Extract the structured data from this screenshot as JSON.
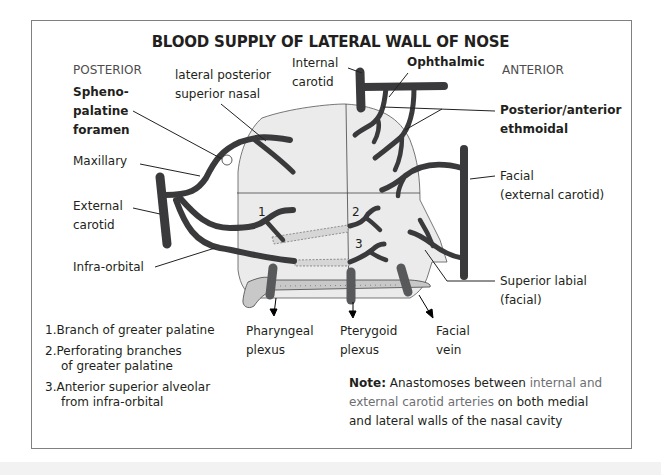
{
  "title": "BLOOD SUPPLY OF LATERAL WALL OF NOSE",
  "orientation": {
    "posterior": "POSTERIOR",
    "anterior": "ANTERIOR"
  },
  "labels": {
    "sphenopalatine_foramen": [
      "Spheno-",
      "palatine",
      "foramen"
    ],
    "lateral_posterior_superior_nasal": [
      "lateral posterior",
      "superior nasal"
    ],
    "internal_carotid": [
      "Internal",
      "carotid"
    ],
    "ophthalmic": "Ophthalmic",
    "posterior_anterior_ethmoidal": [
      "Posterior/anterior",
      "ethmoidal"
    ],
    "maxillary": "Maxillary",
    "external_carotid": [
      "External",
      "carotid"
    ],
    "facial_external_carotid": [
      "Facial",
      "(external carotid)"
    ],
    "infra_orbital": "Infra-orbital",
    "superior_labial": [
      "Superior labial",
      "(facial)"
    ],
    "pharyngeal_plexus": [
      "Pharyngeal",
      "plexus"
    ],
    "pterygoid_plexus": [
      "Pterygoid",
      "plexus"
    ],
    "facial_vein": [
      "Facial",
      "vein"
    ]
  },
  "region_numbers": [
    "1",
    "2",
    "3"
  ],
  "legend": [
    {
      "num": "1.",
      "lines": [
        "Branch of greater palatine"
      ]
    },
    {
      "num": "2.",
      "lines": [
        "Perforating  branches",
        "of greater palatine"
      ]
    },
    {
      "num": "3.",
      "lines": [
        "Anterior superior alveolar",
        "from  infra-orbital"
      ]
    }
  ],
  "note": {
    "prefix": "Note:",
    "text_a": " Anastomoses between ",
    "highlight_a": "internal and",
    "highlight_b": "external carotid arteries",
    "text_b": " on both medial",
    "text_c": "and lateral walls of the nasal cavity"
  },
  "colors": {
    "artery": "#3a3a3c",
    "vein": "#58595b",
    "nose_fill": "#ebebeb",
    "palate_fill": "#c8c8c8",
    "highlight_text": "#6d6e71"
  }
}
